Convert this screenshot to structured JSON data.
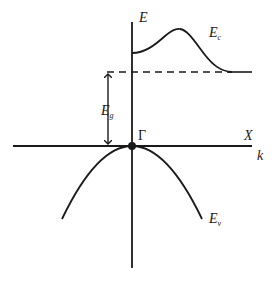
{
  "diagram": {
    "type": "band-structure",
    "colors": {
      "line": "#1a1a1a",
      "background": "#ffffff"
    },
    "labels": {
      "energy_axis": "E",
      "wavevector_axis": "k",
      "gamma_point": "Γ",
      "x_point": "X",
      "conduction_band": {
        "main": "E",
        "sub": "c"
      },
      "valence_band": {
        "main": "E",
        "sub": "v"
      },
      "band_gap": {
        "main": "E",
        "sub": "g"
      }
    },
    "elements": [
      "vertical energy axis",
      "horizontal k axis",
      "conduction band curve with local maximum, minimum at X",
      "dashed line at conduction band minimum level",
      "valence band parabola with maximum at Γ",
      "double-headed arrow indicating band gap",
      "dot marking valence band maximum at Γ"
    ]
  }
}
